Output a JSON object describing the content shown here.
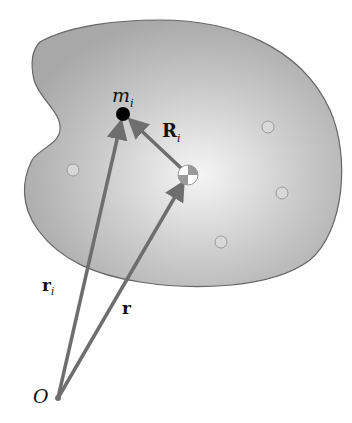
{
  "diagram": {
    "colors": {
      "body_fill_center": "#f2f2f2",
      "body_fill_edge": "#a9a9a9",
      "body_stroke": "#666666",
      "arrow": "#6e6e6e",
      "particle": "#000000",
      "small_circle_fill": "#d8d8d8"
    },
    "labels": {
      "mass": "m",
      "mass_sub": "i",
      "R_vec": "R",
      "R_sub": "i",
      "r_i_vec": "r",
      "r_i_sub": "i",
      "r_vec": "r",
      "origin": "O"
    },
    "points": {
      "origin": [
        58,
        398
      ],
      "particle": [
        123,
        114
      ],
      "center_of_mass": [
        188,
        175
      ]
    },
    "small_circles": [
      [
        73,
        170
      ],
      [
        268,
        127
      ],
      [
        282,
        193
      ],
      [
        221,
        242
      ]
    ]
  }
}
